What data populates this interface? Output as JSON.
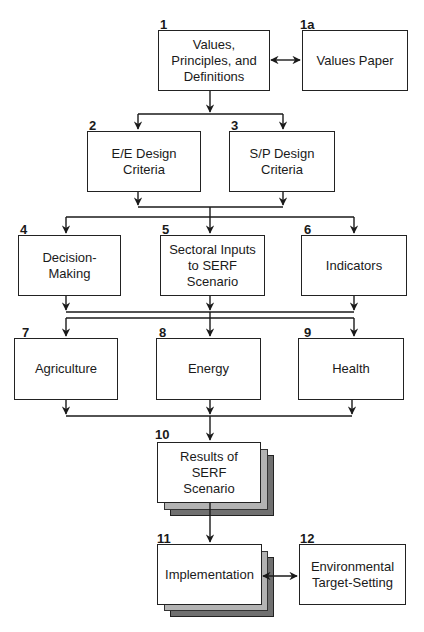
{
  "diagram": {
    "nodes": [
      {
        "id": "1",
        "number": "1",
        "label": "Values, Principles, and Definitions"
      },
      {
        "id": "1a",
        "number": "1a",
        "label": "Values Paper"
      },
      {
        "id": "2",
        "number": "2",
        "label": "E/E Design Criteria"
      },
      {
        "id": "3",
        "number": "3",
        "label": "S/P Design Criteria"
      },
      {
        "id": "4",
        "number": "4",
        "label": "Decision-Making"
      },
      {
        "id": "5",
        "number": "5",
        "label": "Sectoral Inputs to SERF Scenario"
      },
      {
        "id": "6",
        "number": "6",
        "label": "Indicators"
      },
      {
        "id": "7",
        "number": "7",
        "label": "Agriculture"
      },
      {
        "id": "8",
        "number": "8",
        "label": "Energy"
      },
      {
        "id": "9",
        "number": "9",
        "label": "Health"
      },
      {
        "id": "10",
        "number": "10",
        "label": "Results of SERF Scenario"
      },
      {
        "id": "11",
        "number": "11",
        "label": "Implementation"
      },
      {
        "id": "12",
        "number": "12",
        "label": "Environmental Target-Setting"
      }
    ],
    "edges": [
      {
        "from": "1",
        "to": "1a",
        "type": "bidirectional"
      },
      {
        "from": "1",
        "to": "2"
      },
      {
        "from": "1",
        "to": "3"
      },
      {
        "from": "2",
        "to": "4"
      },
      {
        "from": "2",
        "to": "5"
      },
      {
        "from": "2",
        "to": "6"
      },
      {
        "from": "3",
        "to": "4"
      },
      {
        "from": "3",
        "to": "5"
      },
      {
        "from": "3",
        "to": "6"
      },
      {
        "from": "4",
        "to": "7"
      },
      {
        "from": "4",
        "to": "8"
      },
      {
        "from": "4",
        "to": "9"
      },
      {
        "from": "5",
        "to": "7"
      },
      {
        "from": "5",
        "to": "8"
      },
      {
        "from": "5",
        "to": "9"
      },
      {
        "from": "6",
        "to": "7"
      },
      {
        "from": "6",
        "to": "8"
      },
      {
        "from": "6",
        "to": "9"
      },
      {
        "from": "7",
        "to": "10"
      },
      {
        "from": "8",
        "to": "10"
      },
      {
        "from": "9",
        "to": "10"
      },
      {
        "from": "10",
        "to": "11"
      },
      {
        "from": "11",
        "to": "12",
        "type": "bidirectional"
      }
    ]
  },
  "colors": {
    "line": "#1a1a1a",
    "stack_light": "#b3b3b3",
    "stack_dark": "#707070"
  }
}
